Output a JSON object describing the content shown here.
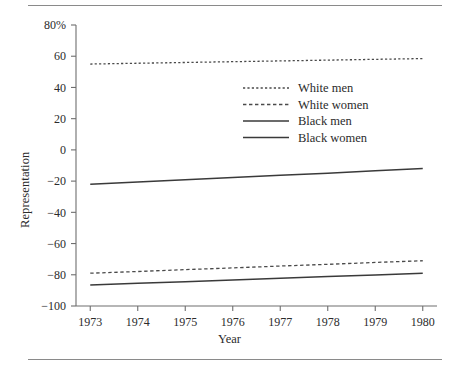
{
  "figure": {
    "ylabel": "Representation",
    "xlabel": "Year"
  },
  "chart_data": {
    "type": "line",
    "title": "",
    "subtitle": "",
    "xlabel": "Year",
    "ylabel": "Representation",
    "xlim": [
      1972.7,
      1980.3
    ],
    "ylim": [
      -100,
      80
    ],
    "grid": false,
    "legend_position": "upper-center-right",
    "x": [
      1973,
      1974,
      1975,
      1976,
      1977,
      1978,
      1979,
      1980
    ],
    "xticklabels": [
      "1973",
      "1974",
      "1975",
      "1976",
      "1977",
      "1978",
      "1979",
      "1980"
    ],
    "yticks": [
      80,
      60,
      40,
      20,
      0,
      -20,
      -40,
      -60,
      -80,
      -100
    ],
    "yticklabels": [
      "80%",
      "60",
      "40",
      "20",
      "0",
      "−20",
      "−40",
      "−60",
      "−80",
      "−100"
    ],
    "series": [
      {
        "name": "White men",
        "style": "dotted",
        "color": "#4a4a4a",
        "values": [
          55.0,
          55.5,
          56.0,
          56.5,
          57.0,
          57.5,
          58.0,
          58.5
        ]
      },
      {
        "name": "White women",
        "style": "dashed",
        "color": "#4a4a4a",
        "values": [
          -79.0,
          -77.9,
          -76.7,
          -75.6,
          -74.4,
          -73.3,
          -72.1,
          -71.0
        ]
      },
      {
        "name": "Black men",
        "style": "solid",
        "color": "#3a3a3a",
        "values": [
          -22.0,
          -20.6,
          -19.1,
          -17.7,
          -16.3,
          -14.9,
          -13.4,
          -12.0
        ]
      },
      {
        "name": "Black women",
        "style": "solid",
        "color": "#3a3a3a",
        "values": [
          -86.5,
          -85.4,
          -84.4,
          -83.3,
          -82.2,
          -81.1,
          -80.1,
          -79.0
        ]
      }
    ]
  },
  "legend": {
    "items": [
      {
        "label": "White men"
      },
      {
        "label": "White women"
      },
      {
        "label": "Black men"
      },
      {
        "label": "Black women"
      }
    ]
  },
  "colors": {
    "axis": "#6e6e6e",
    "rule": "#8a8a8a",
    "text": "#2b2b2b",
    "line_dark": "#3a3a3a",
    "line_light": "#4a4a4a"
  }
}
